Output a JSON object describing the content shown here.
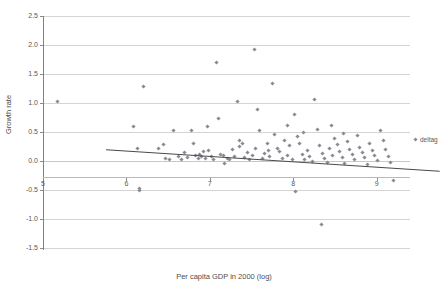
{
  "chart_data": {
    "type": "scatter",
    "title": "",
    "xlabel": "Per capita GDP in 2000 (log)",
    "ylabel": "Growth rate",
    "xlim": [
      5,
      9.4
    ],
    "ylim": [
      -1.5,
      2.5
    ],
    "xticks": [
      "5",
      "6",
      "7",
      "8",
      "9"
    ],
    "xtick_values": [
      5,
      6,
      7,
      8,
      9
    ],
    "yticks": [
      "-1.5",
      "-1.0",
      "-0.5",
      "0.0",
      "0.5",
      "1.0",
      "1.5",
      "2.0",
      "2.5"
    ],
    "ytick_values": [
      -1.5,
      -1.0,
      -0.5,
      0.0,
      0.5,
      1.0,
      1.5,
      2.0,
      2.5
    ],
    "grid": "horizontal",
    "legend_position": "right",
    "series": [
      {
        "name": "deltag",
        "marker": "diamond",
        "color": "#8a8a94",
        "points": [
          [
            5.17,
            1.03
          ],
          [
            6.08,
            0.6
          ],
          [
            6.13,
            0.22
          ],
          [
            6.16,
            -0.48
          ],
          [
            6.2,
            1.29
          ],
          [
            6.39,
            0.22
          ],
          [
            6.47,
            0.05
          ],
          [
            6.52,
            0.03
          ],
          [
            6.57,
            0.52
          ],
          [
            6.62,
            0.08
          ],
          [
            6.66,
            0.02
          ],
          [
            6.7,
            0.14
          ],
          [
            6.73,
            0.06
          ],
          [
            6.78,
            0.53
          ],
          [
            6.8,
            0.3
          ],
          [
            6.83,
            0.1
          ],
          [
            6.86,
            0.05
          ],
          [
            6.88,
            0.12
          ],
          [
            6.9,
            0.08
          ],
          [
            6.92,
            0.16
          ],
          [
            6.95,
            0.04
          ],
          [
            6.97,
            0.6
          ],
          [
            6.99,
            0.18
          ],
          [
            7.02,
            0.07
          ],
          [
            7.05,
            0.02
          ],
          [
            7.08,
            1.69
          ],
          [
            7.1,
            0.74
          ],
          [
            7.13,
            0.12
          ],
          [
            7.16,
            0.1
          ],
          [
            7.18,
            -0.05
          ],
          [
            7.21,
            0.05
          ],
          [
            7.24,
            0.03
          ],
          [
            7.27,
            0.2
          ],
          [
            7.3,
            0.08
          ],
          [
            7.33,
            1.02
          ],
          [
            7.36,
            0.35
          ],
          [
            7.39,
            0.3
          ],
          [
            7.42,
            0.06
          ],
          [
            7.45,
            0.14
          ],
          [
            7.48,
            0.02
          ],
          [
            7.51,
            0.09
          ],
          [
            7.54,
            1.93
          ],
          [
            7.57,
            0.88
          ],
          [
            7.6,
            0.52
          ],
          [
            7.63,
            0.04
          ],
          [
            7.66,
            0.13
          ],
          [
            7.69,
            0.3
          ],
          [
            7.72,
            0.07
          ],
          [
            7.75,
            1.33
          ],
          [
            7.78,
            0.45
          ],
          [
            7.81,
            0.22
          ],
          [
            7.84,
            0.16
          ],
          [
            7.87,
            0.05
          ],
          [
            7.9,
            0.35
          ],
          [
            7.93,
            0.1
          ],
          [
            7.96,
            0.26
          ],
          [
            7.99,
            0.03
          ],
          [
            8.02,
            0.8
          ],
          [
            8.05,
            0.42
          ],
          [
            8.08,
            0.31
          ],
          [
            8.11,
            0.12
          ],
          [
            8.14,
            0.02
          ],
          [
            8.17,
            0.18
          ],
          [
            8.2,
            0.08
          ],
          [
            8.23,
            0.0
          ],
          [
            8.26,
            1.06
          ],
          [
            8.29,
            0.55
          ],
          [
            8.32,
            0.26
          ],
          [
            8.35,
            0.13
          ],
          [
            8.38,
            0.04
          ],
          [
            8.41,
            -0.02
          ],
          [
            8.44,
            0.22
          ],
          [
            8.47,
            0.1
          ],
          [
            8.5,
            0.38
          ],
          [
            8.53,
            0.28
          ],
          [
            8.56,
            0.16
          ],
          [
            8.59,
            0.06
          ],
          [
            8.62,
            -0.04
          ],
          [
            8.65,
            0.33
          ],
          [
            8.68,
            0.2
          ],
          [
            8.71,
            0.11
          ],
          [
            8.74,
            0.02
          ],
          [
            8.77,
            0.44
          ],
          [
            8.8,
            0.24
          ],
          [
            8.83,
            0.14
          ],
          [
            8.86,
            0.06
          ],
          [
            8.89,
            -0.06
          ],
          [
            8.92,
            0.3
          ],
          [
            8.95,
            0.18
          ],
          [
            8.98,
            0.09
          ],
          [
            9.01,
            0.01
          ],
          [
            9.05,
            0.52
          ],
          [
            9.08,
            0.36
          ],
          [
            9.11,
            0.2
          ],
          [
            9.14,
            0.08
          ],
          [
            9.17,
            -0.02
          ],
          [
            9.2,
            -0.34
          ],
          [
            8.03,
            -0.52
          ],
          [
            6.16,
            -0.5
          ],
          [
            8.34,
            -1.1
          ],
          [
            7.93,
            0.62
          ],
          [
            8.12,
            0.5
          ],
          [
            8.46,
            0.62
          ],
          [
            8.6,
            0.47
          ],
          [
            7.35,
            0.25
          ],
          [
            7.55,
            0.22
          ],
          [
            7.7,
            0.18
          ],
          [
            6.45,
            0.28
          ]
        ]
      }
    ],
    "trendline": {
      "x_start": 5.24,
      "y_start": 0.47,
      "x_end": 9.24,
      "y_end": 0.1,
      "color": "#4a4a4a"
    }
  },
  "legend": {
    "entries": [
      {
        "label": "deltag",
        "marker": "diamond-marker"
      }
    ]
  }
}
